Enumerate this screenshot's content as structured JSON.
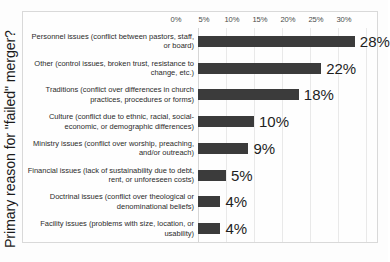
{
  "chart_data": {
    "type": "bar",
    "orientation": "horizontal",
    "title": "",
    "xlabel": "",
    "ylabel": "Primary reason for \"failed\" merger?",
    "xlim": [
      0,
      30
    ],
    "grid": true,
    "legend": "none",
    "tick_labels": [
      "0%",
      "5%",
      "10%",
      "15%",
      "20%",
      "25%",
      "30%"
    ],
    "tick_values": [
      0,
      5,
      10,
      15,
      20,
      25,
      30
    ],
    "categories": [
      "Personnel issues (conflict between pastors, staff, or board)",
      "Other (control issues, broken trust, resistance to change, etc.)",
      "Traditions (conflict over differences in church practices, procedures or forms)",
      "Culture (conflict due to ethnic, racial, social-economic, or demographic differences)",
      "Ministry issues (conflict over worship, preaching, and/or outreach)",
      "Financial issues (lack of sustainability due to debt, rent, or unforeseen costs)",
      "Doctrinal issues (conflict over theological or denominational beliefs)",
      "Facility issues (problems with size, location, or usability)"
    ],
    "values": [
      28,
      22,
      18,
      10,
      9,
      5,
      4,
      4
    ],
    "value_labels": [
      "28%",
      "22%",
      "18%",
      "10%",
      "9%",
      "5%",
      "4%",
      "4%"
    ],
    "bar_color": "#3b3b3b",
    "gridline_color": "#e9e9e9",
    "background_color": "#fefefe",
    "label_color": "#1f1f1f"
  }
}
